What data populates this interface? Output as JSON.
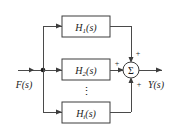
{
  "diagram": {
    "type": "block-diagram",
    "background_color": "#ffffff",
    "line_color": "#4a4a4a",
    "text_color": "#1a1a1a",
    "input": {
      "label": "F(s)",
      "name_base": "F",
      "name_arg": "(s)"
    },
    "output": {
      "label": "Y(s)",
      "name_base": "Y",
      "name_arg": "(s)"
    },
    "branch_node": {
      "label": "branch-point"
    },
    "blocks": [
      {
        "base": "H",
        "subscript": "1",
        "arg": "(s)",
        "label": "H1(s)"
      },
      {
        "base": "H",
        "subscript": "2",
        "arg": "(s)",
        "label": "H2(s)"
      },
      {
        "base": "H",
        "subscript": "i",
        "arg": "(s)",
        "label": "Hi(s)"
      }
    ],
    "ellipsis": {
      "glyph": "⋮",
      "meaning": "additional parallel blocks omitted"
    },
    "summing_junction": {
      "glyph": "Σ",
      "signs": [
        {
          "position": "top",
          "symbol": "+"
        },
        {
          "position": "left",
          "symbol": "+"
        },
        {
          "position": "bottom",
          "symbol": "+"
        }
      ]
    }
  }
}
